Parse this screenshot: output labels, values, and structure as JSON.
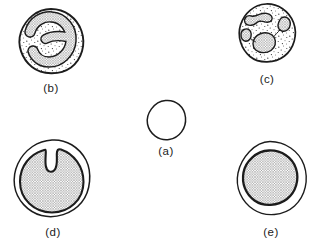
{
  "figure": {
    "background": "#ffffff",
    "ink_color": "#1c1c1c",
    "nucleus_texture": "crosshatch",
    "cytoplasm_texture": "stipple-dots",
    "cells": [
      {
        "id": "a",
        "label": "(a)",
        "appearance": "small plain circle"
      },
      {
        "id": "b",
        "label": "(b)",
        "appearance": "stippled cell with curved hooked nucleus"
      },
      {
        "id": "c",
        "label": "(c)",
        "appearance": "stippled cell with multiple nuclear lobes"
      },
      {
        "id": "d",
        "label": "(d)",
        "appearance": "large cell with notched horseshoe nucleus"
      },
      {
        "id": "e",
        "label": "(e)",
        "appearance": "cell with large round nucleus"
      }
    ]
  }
}
